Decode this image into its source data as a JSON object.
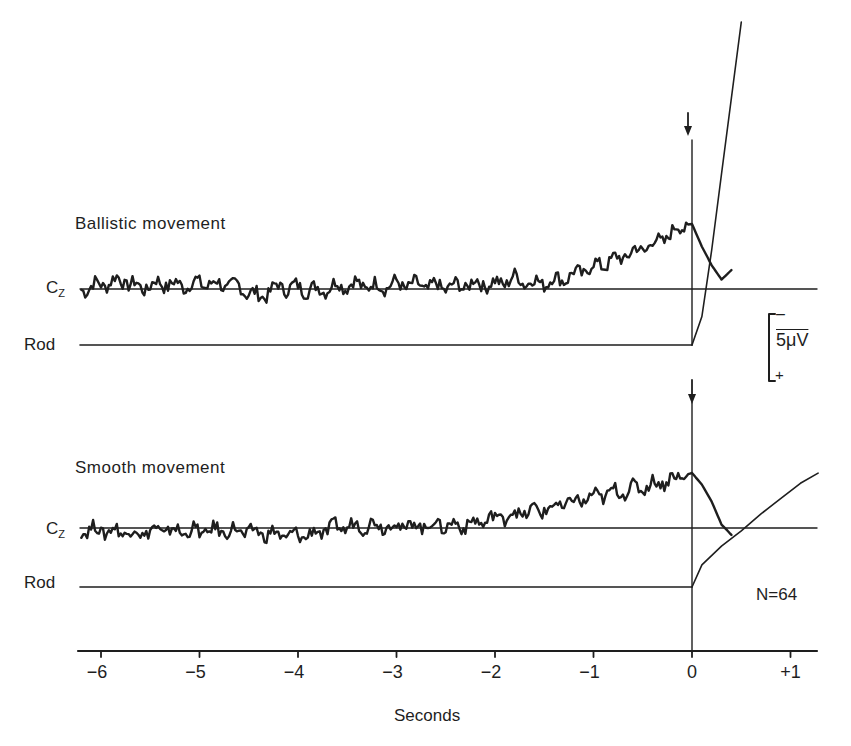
{
  "chart_data": {
    "type": "line",
    "title": "",
    "xlabel": "Seconds",
    "ylabel": "",
    "xlim": [
      -6.3,
      1.28
    ],
    "x_ticks": [
      -6,
      -5,
      -4,
      -3,
      -2,
      -1,
      0,
      1
    ],
    "x_tick_labels": [
      "−6",
      "−5",
      "−4",
      "−3",
      "−2",
      "−1",
      "0",
      "+1"
    ],
    "grid": false,
    "scale_bar": {
      "label": "5μV",
      "negative_sign": "–",
      "positive_sign": "+",
      "note": "negative up"
    },
    "annotation": "N=64",
    "panels": [
      {
        "name": "Ballistic movement",
        "arrow_at_seconds": 0,
        "series": [
          {
            "name": "Cz",
            "units": "μV (relative, negative up)",
            "x": [
              -6.2,
              -6.0,
              -5.8,
              -5.6,
              -5.4,
              -5.2,
              -5.0,
              -4.8,
              -4.6,
              -4.4,
              -4.2,
              -4.0,
              -3.8,
              -3.6,
              -3.4,
              -3.2,
              -3.0,
              -2.8,
              -2.6,
              -2.4,
              -2.2,
              -2.0,
              -1.8,
              -1.6,
              -1.4,
              -1.2,
              -1.0,
              -0.8,
              -0.6,
              -0.4,
              -0.2,
              -0.1,
              0.0,
              0.1,
              0.2,
              0.3,
              0.4
            ],
            "values": [
              0.0,
              0.8,
              1.6,
              0.2,
              1.0,
              0.6,
              1.0,
              0.8,
              0.4,
              -1.4,
              0.4,
              0.2,
              -0.2,
              0.6,
              0.8,
              0.4,
              0.8,
              0.6,
              0.4,
              0.4,
              1.0,
              0.8,
              1.8,
              1.0,
              1.4,
              2.4,
              3.8,
              4.8,
              6.2,
              7.6,
              9.4,
              10.8,
              11.0,
              7.2,
              4.0,
              1.6,
              3.2
            ]
          },
          {
            "name": "Rod",
            "units": "position (relative)",
            "x": [
              -6.2,
              0.0,
              0.1,
              0.2,
              0.3,
              0.4,
              0.5
            ],
            "values": [
              0,
              0,
              3,
              10,
              18,
              26,
              34
            ]
          }
        ]
      },
      {
        "name": "Smooth movement",
        "arrow_at_seconds": 0,
        "series": [
          {
            "name": "Cz",
            "units": "μV (relative, negative up)",
            "x": [
              -6.2,
              -6.0,
              -5.8,
              -5.6,
              -5.4,
              -5.2,
              -5.0,
              -4.8,
              -4.6,
              -4.4,
              -4.2,
              -4.0,
              -3.8,
              -3.6,
              -3.4,
              -3.2,
              -3.0,
              -2.8,
              -2.6,
              -2.4,
              -2.2,
              -2.0,
              -1.8,
              -1.6,
              -1.4,
              -1.2,
              -1.0,
              -0.8,
              -0.6,
              -0.4,
              -0.2,
              0.0,
              0.1,
              0.2,
              0.3,
              0.4
            ],
            "values": [
              -0.2,
              -0.4,
              -0.6,
              -0.8,
              -0.4,
              -0.6,
              -0.6,
              -0.4,
              -0.6,
              -0.8,
              -1.2,
              -1.4,
              -0.8,
              0.2,
              0.4,
              0.6,
              0.4,
              0.4,
              0.6,
              0.4,
              0.8,
              1.8,
              2.4,
              3.0,
              3.6,
              4.6,
              5.4,
              6.2,
              6.8,
              7.6,
              8.6,
              9.6,
              7.6,
              4.6,
              0.6,
              -1.2
            ]
          },
          {
            "name": "Rod",
            "units": "position (relative)",
            "x": [
              -6.2,
              0.0,
              0.1,
              0.3,
              0.5,
              0.7,
              0.9,
              1.1,
              1.28
            ],
            "values": [
              0,
              0,
              2.6,
              4.8,
              6.6,
              8.6,
              10.4,
              12.2,
              13.4
            ]
          }
        ]
      }
    ]
  },
  "labels": {
    "panel1_title": "Ballistic movement",
    "panel2_title": "Smooth movement",
    "cz_main": "C",
    "cz_sub": "Z",
    "rod": "Rod",
    "scale_minus": "–",
    "scale_value": "5μV",
    "scale_plus": "+",
    "n_label": "N=64",
    "xlabel": "Seconds"
  }
}
